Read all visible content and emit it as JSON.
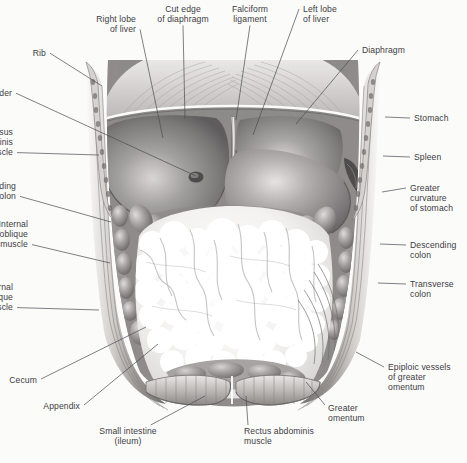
{
  "figure": {
    "style": "grayscale medical illustration",
    "background_color": "#fbfbfa",
    "text_color": "#3b3b42",
    "leader_color": "#4a4a52"
  },
  "labels": [
    {
      "id": "right-lobe-of-liver",
      "text": "Right lobe\nof liver",
      "align": "right",
      "x": 136,
      "y": 14,
      "anchor_x": 163,
      "anchor_y": 138
    },
    {
      "id": "cut-edge-of-diaphragm",
      "text": "Cut edge\nof diaphragm",
      "align": "center",
      "x": 183,
      "y": 4,
      "anchor_x": 185,
      "anchor_y": 119
    },
    {
      "id": "falciform-ligament",
      "text": "Falciform\nligament",
      "align": "center",
      "x": 250,
      "y": 4,
      "anchor_x": 236,
      "anchor_y": 120
    },
    {
      "id": "left-lobe-of-liver",
      "text": "Left lobe\nof liver",
      "align": "left",
      "x": 303,
      "y": 4,
      "anchor_x": 253,
      "anchor_y": 135
    },
    {
      "id": "diaphragm",
      "text": "Diaphragm",
      "align": "left",
      "x": 362,
      "y": 45,
      "anchor_x": 296,
      "anchor_y": 124
    },
    {
      "id": "rib",
      "text": "Rib",
      "align": "right",
      "x": 46,
      "y": 48,
      "anchor_x": 102,
      "anchor_y": 86
    },
    {
      "id": "gallbladder",
      "text": "Gallbladder",
      "align": "right",
      "x": 12,
      "y": 88,
      "anchor_x": 196,
      "anchor_y": 176
    },
    {
      "id": "transversus-abdominis",
      "text": "Transversus\nabdominis\nmuscle",
      "align": "right",
      "x": 13,
      "y": 127,
      "anchor_x": 99,
      "anchor_y": 155
    },
    {
      "id": "ascending-colon",
      "text": "Ascending\ncolon",
      "align": "right",
      "x": 16,
      "y": 181,
      "anchor_x": 111,
      "anchor_y": 222
    },
    {
      "id": "internal-oblique",
      "text": "Internal\noblique\nmuscle",
      "align": "right",
      "x": 28,
      "y": 219,
      "anchor_x": 110,
      "anchor_y": 263
    },
    {
      "id": "external-oblique",
      "text": "External\noblique\nmuscle",
      "align": "right",
      "x": 13,
      "y": 282,
      "anchor_x": 99,
      "anchor_y": 310
    },
    {
      "id": "cecum",
      "text": "Cecum",
      "align": "right",
      "x": 37,
      "y": 375,
      "anchor_x": 146,
      "anchor_y": 327
    },
    {
      "id": "appendix",
      "text": "Appendix",
      "align": "right",
      "x": 80,
      "y": 401,
      "anchor_x": 158,
      "anchor_y": 344
    },
    {
      "id": "small-intestine-ileum",
      "text": "Small intestine\n(ileum)",
      "align": "center",
      "x": 128,
      "y": 426,
      "anchor_x": 205,
      "anchor_y": 396
    },
    {
      "id": "rectus-abdominis",
      "text": "Rectus abdominis\nmuscle",
      "align": "left",
      "x": 244,
      "y": 426,
      "anchor_x": 246,
      "anchor_y": 396
    },
    {
      "id": "greater-omentum",
      "text": "Greater\nomentum",
      "align": "left",
      "x": 328,
      "y": 403,
      "anchor_x": 306,
      "anchor_y": 382
    },
    {
      "id": "stomach",
      "text": "Stomach",
      "align": "left",
      "x": 414,
      "y": 113,
      "anchor_x": 385,
      "anchor_y": 117
    },
    {
      "id": "spleen",
      "text": "Spleen",
      "align": "left",
      "x": 414,
      "y": 152,
      "anchor_x": 383,
      "anchor_y": 156
    },
    {
      "id": "greater-curvature",
      "text": "Greater\ncurvature\nof stomach",
      "align": "left",
      "x": 410,
      "y": 183,
      "anchor_x": 382,
      "anchor_y": 192
    },
    {
      "id": "descending-colon",
      "text": "Descending\ncolon",
      "align": "left",
      "x": 410,
      "y": 240,
      "anchor_x": 380,
      "anchor_y": 244
    },
    {
      "id": "transverse-colon",
      "text": "Transverse\ncolon",
      "align": "left",
      "x": 410,
      "y": 279,
      "anchor_x": 378,
      "anchor_y": 283
    },
    {
      "id": "epiploic-vessels",
      "text": "Epiploic vessels\nof greater\nomentum",
      "align": "left",
      "x": 388,
      "y": 362,
      "anchor_x": 356,
      "anchor_y": 352
    }
  ],
  "structures": [
    {
      "id": "diaphragm",
      "label": "Diaphragm (radiating muscle fibers)"
    },
    {
      "id": "right-lobe-liver",
      "label": "Right lobe of liver"
    },
    {
      "id": "left-lobe-liver",
      "label": "Left lobe of liver"
    },
    {
      "id": "falciform-ligament",
      "label": "Falciform ligament"
    },
    {
      "id": "gallbladder",
      "label": "Gallbladder fundus"
    },
    {
      "id": "stomach",
      "label": "Stomach with greater curvature"
    },
    {
      "id": "transverse-colon",
      "label": "Transverse colon haustra"
    },
    {
      "id": "ascending-colon",
      "label": "Ascending colon"
    },
    {
      "id": "descending-colon",
      "label": "Descending colon"
    },
    {
      "id": "greater-omentum",
      "label": "Greater omentum (fatty apron)"
    },
    {
      "id": "cecum",
      "label": "Cecum"
    },
    {
      "id": "appendix",
      "label": "Vermiform appendix"
    },
    {
      "id": "small-intestine",
      "label": "Small intestine (ileum)"
    },
    {
      "id": "rectus-abdominis",
      "label": "Rectus abdominis muscle flaps"
    },
    {
      "id": "abdominal-wall-left",
      "label": "Layered abdominal wall, left cut edge"
    },
    {
      "id": "abdominal-wall-right",
      "label": "Layered abdominal wall, right cut edge"
    },
    {
      "id": "rib-left",
      "label": "Cut rib, left"
    },
    {
      "id": "rib-right",
      "label": "Cut rib, right"
    }
  ]
}
